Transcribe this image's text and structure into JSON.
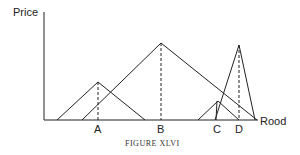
{
  "diagram": {
    "y_axis_label": "Price",
    "x_axis_label": "Rood",
    "caption": "FIGURE XLVI",
    "points": [
      {
        "label": "A",
        "x": 98
      },
      {
        "label": "B",
        "x": 161
      },
      {
        "label": "C",
        "x": 217
      },
      {
        "label": "D",
        "x": 239
      }
    ],
    "line_color": "#222222",
    "background": "#ffffff"
  }
}
